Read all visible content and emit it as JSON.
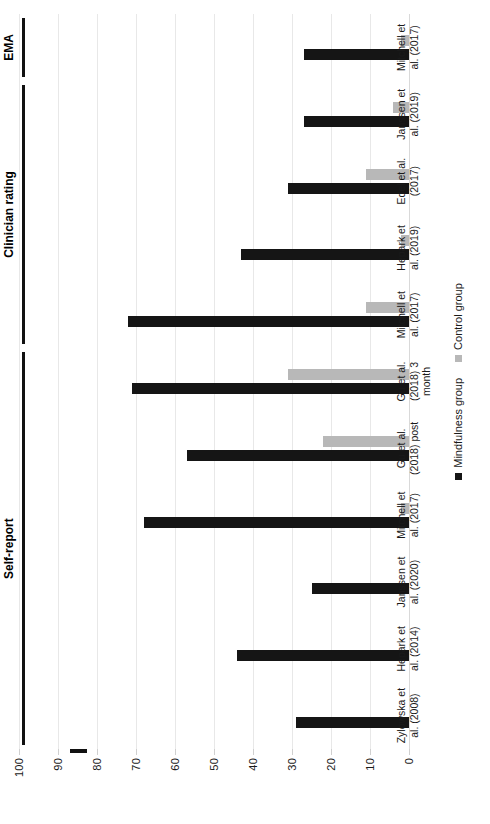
{
  "chart_data": {
    "type": "bar",
    "title": "",
    "subtitle": "",
    "orientation": "horizontal-rotated",
    "xlabel": "",
    "ylabel": "",
    "ylim": [
      0,
      100
    ],
    "grid": true,
    "legend_position": "bottom",
    "axis_ticks": [
      "100",
      "90",
      "80",
      "70",
      "60",
      "50",
      "40",
      "30",
      "20",
      "10",
      "0"
    ],
    "axis_tick_values": [
      100,
      90,
      80,
      70,
      60,
      50,
      40,
      30,
      20,
      10,
      0
    ],
    "categories": [
      "Zylowska et al. (2008)",
      "Hepark et al. (2014)",
      "Janssen et al. (2020)",
      "Mitchell et al. (2017)",
      "Gu et al. (2018) post",
      "Gu et al. (2018) 3 month",
      "Mitchell et al. (2017)",
      "Hepark et al. (2019)",
      "Edel et al. (2017)",
      "Janssen et al. (2019)",
      "Mitchell et al. (2017)"
    ],
    "category_lines": [
      [
        "Zylowska et",
        "al. (2008)"
      ],
      [
        "Hepark et",
        "al. (2014)"
      ],
      [
        "Janssen et",
        "al. (2020)"
      ],
      [
        "Mitchell et",
        "al. (2017)"
      ],
      [
        "Gu et al.",
        "(2018) post"
      ],
      [
        "Gu et al.",
        "(2018) 3",
        "month"
      ],
      [
        "Mitchell et",
        "al. (2017)"
      ],
      [
        "Hepark et",
        "al. (2019)"
      ],
      [
        "Edel et al.",
        "(2017)"
      ],
      [
        "Janssen et",
        "al. (2019)"
      ],
      [
        "Mitchell et",
        "al. (2017)"
      ]
    ],
    "series": [
      {
        "name": "Mindfulness group",
        "color": "#151515",
        "values": [
          29,
          44,
          25,
          68,
          57,
          71,
          72,
          43,
          31,
          27,
          27
        ]
      },
      {
        "name": "Control group",
        "color": "#b8b8b8",
        "values": [
          null,
          null,
          null,
          2,
          22,
          31,
          11,
          2,
          11,
          4,
          2
        ]
      }
    ],
    "groups": [
      {
        "label": "Self-report",
        "start_index": 0,
        "end_index": 5
      },
      {
        "label": "Clinician rating",
        "start_index": 6,
        "end_index": 9
      },
      {
        "label": "EMA",
        "start_index": 10,
        "end_index": 10
      }
    ]
  },
  "legend": {
    "items": [
      {
        "label": "Mindfulness group",
        "color": "#151515"
      },
      {
        "label": "Control group",
        "color": "#b8b8b8"
      }
    ]
  }
}
